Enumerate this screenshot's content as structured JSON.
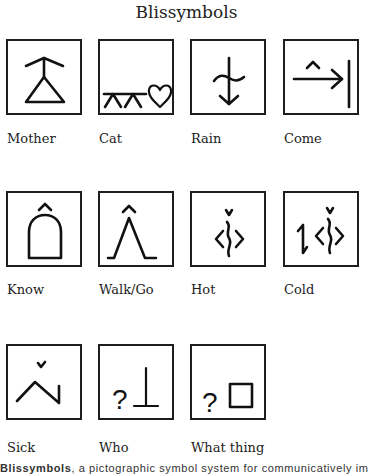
{
  "title": "Blissymbols",
  "symbols": [
    {
      "label": "Mother",
      "icon": "mother-symbol"
    },
    {
      "label": "Cat",
      "icon": "cat-symbol"
    },
    {
      "label": "Rain",
      "icon": "rain-symbol"
    },
    {
      "label": "Come",
      "icon": "come-symbol"
    },
    {
      "label": "Know",
      "icon": "know-symbol"
    },
    {
      "label": "Walk/Go",
      "icon": "walk-go-symbol"
    },
    {
      "label": "Hot",
      "icon": "hot-symbol"
    },
    {
      "label": "Cold",
      "icon": "cold-symbol"
    },
    {
      "label": "Sick",
      "icon": "sick-symbol"
    },
    {
      "label": "Who",
      "icon": "who-symbol",
      "glyph": "?"
    },
    {
      "label": "What thing",
      "icon": "what-thing-symbol",
      "glyph": "?"
    }
  ],
  "caption": {
    "bold": "Blissymbols",
    "text": ", a pictographic symbol system for communicatively im"
  }
}
